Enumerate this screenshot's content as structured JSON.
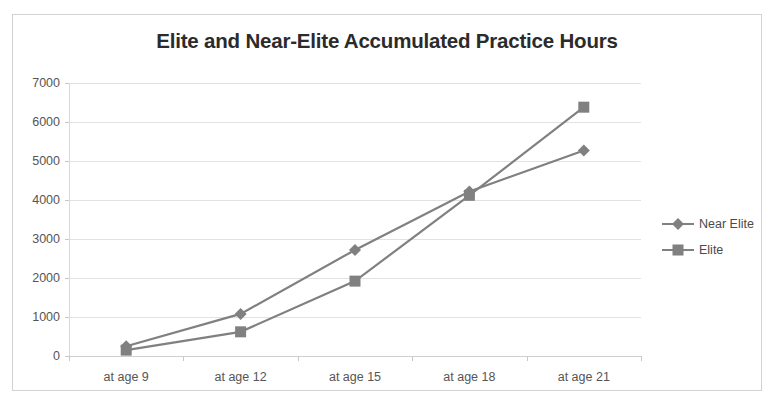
{
  "chart_data": {
    "type": "line",
    "title": "Elite and Near-Elite Accumulated Practice Hours",
    "xlabel": "",
    "ylabel": "",
    "categories": [
      "at age 9",
      "at age 12",
      "at age 15",
      "at age 18",
      "at age 21"
    ],
    "series": [
      {
        "name": "Near Elite",
        "marker": "diamond",
        "color": "#808080",
        "values": [
          250,
          1080,
          2720,
          4220,
          5270
        ]
      },
      {
        "name": "Elite",
        "marker": "square",
        "color": "#808080",
        "values": [
          150,
          620,
          1920,
          4120,
          6380
        ]
      }
    ],
    "ylim": [
      0,
      7000
    ],
    "y_ticks": [
      "0",
      "1000",
      "2000",
      "3000",
      "4000",
      "5000",
      "6000",
      "7000"
    ],
    "grid": true,
    "legend_position": "right"
  },
  "legend": {
    "entries": [
      {
        "label": "Near Elite"
      },
      {
        "label": "Elite"
      }
    ]
  },
  "colors": {
    "series": "#808080",
    "grid": "#e2e2e2",
    "text": "#555555",
    "title": "#2b2b2b",
    "border": "#d2d2d2"
  }
}
